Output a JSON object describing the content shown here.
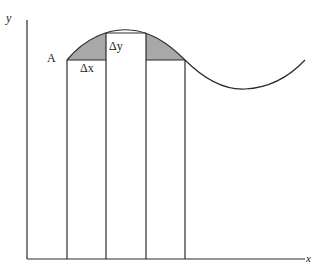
{
  "diagram": {
    "axis_labels": {
      "y": "y",
      "x": "x"
    },
    "point_label": "A",
    "delta_x_label": "Δx",
    "delta_y_label": "Δy",
    "colors": {
      "line": "#2a2a2a",
      "shade": "#a8a8a8",
      "background": "#ffffff"
    }
  }
}
